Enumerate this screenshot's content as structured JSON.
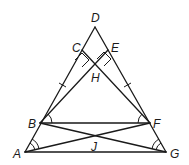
{
  "diagram": {
    "type": "geometry",
    "points": {
      "A": {
        "label": "A",
        "x": 25,
        "y": 152
      },
      "B": {
        "label": "B",
        "x": 40,
        "y": 123
      },
      "C": {
        "label": "C",
        "x": 82,
        "y": 50
      },
      "D": {
        "label": "D",
        "x": 95,
        "y": 27
      },
      "E": {
        "label": "E",
        "x": 108,
        "y": 50
      },
      "F": {
        "label": "F",
        "x": 150,
        "y": 123
      },
      "G": {
        "label": "G",
        "x": 166,
        "y": 152
      },
      "H": {
        "label": "H",
        "x": 95,
        "y": 66
      },
      "J": {
        "label": "J",
        "x": 95,
        "y": 137
      }
    },
    "segments": [
      "AD",
      "GD",
      "AG",
      "BF",
      "BE",
      "FC",
      "BG",
      "AF"
    ],
    "marks": {
      "congruent_ticks": [
        "BC",
        "EF"
      ],
      "right_angles": [
        "CHB",
        "EHF"
      ],
      "single_arcs": [
        "FBE",
        "BFC"
      ],
      "double_arcs": [
        "GAF",
        "AGB"
      ]
    }
  }
}
